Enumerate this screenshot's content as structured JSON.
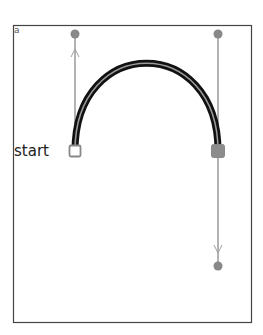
{
  "diagram": {
    "type": "bezier-curve-editor",
    "corner_label": "a",
    "start_label": "start",
    "frame": {
      "x": 13,
      "y": 25,
      "width": 239,
      "height": 298,
      "stroke": "#444444"
    },
    "curve": {
      "start": {
        "x": 75,
        "y": 151
      },
      "control1": {
        "x": 75,
        "y": 34
      },
      "control2": {
        "x": 218,
        "y": 34
      },
      "end": {
        "x": 218,
        "y": 151
      },
      "outer_color": "#111111",
      "inner_color": "#9a9a9a"
    },
    "handles": [
      {
        "name": "start-handle",
        "from": {
          "x": 75,
          "y": 151
        },
        "to": {
          "x": 75,
          "y": 34
        }
      },
      {
        "name": "end-handle-up",
        "from": {
          "x": 218,
          "y": 151
        },
        "to": {
          "x": 218,
          "y": 34
        }
      },
      {
        "name": "end-handle-down",
        "from": {
          "x": 218,
          "y": 151
        },
        "to": {
          "x": 218,
          "y": 266
        }
      }
    ],
    "colors": {
      "handle_line": "#8a8a8a",
      "control_point": "#888888",
      "anchor_start_fill": "#ffffff",
      "anchor_start_stroke": "#888888",
      "anchor_end_fill": "#8c8c8c"
    }
  }
}
